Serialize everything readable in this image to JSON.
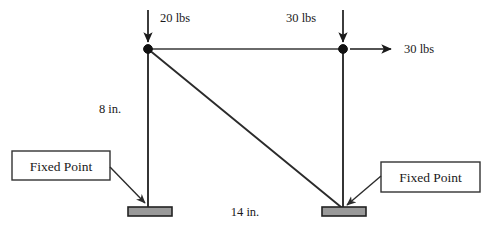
{
  "diagram": {
    "colors": {
      "line": "#2b2b2b",
      "node": "#111111",
      "support_fill": "#9a9a9a",
      "support_stroke": "#222222",
      "text": "#1a1a1a",
      "background": "#ffffff"
    },
    "loads": [
      {
        "id": "load-top-left",
        "label": "20 lbs",
        "direction": "down",
        "applied_at": "left-node"
      },
      {
        "id": "load-top-right",
        "label": "30 lbs",
        "direction": "down",
        "applied_at": "right-node"
      },
      {
        "id": "load-right",
        "label": "30 lbs",
        "direction": "right",
        "applied_at": "right-node"
      }
    ],
    "dimensions": [
      {
        "id": "dim-vertical",
        "label": "8 in.",
        "measures": "left column height"
      },
      {
        "id": "dim-horizontal",
        "label": "14 in.",
        "measures": "span between supports"
      }
    ],
    "callouts": [
      {
        "id": "callout-left",
        "label": "Fixed Point",
        "points_to": "left-support"
      },
      {
        "id": "callout-right",
        "label": "Fixed Point",
        "points_to": "right-support"
      }
    ],
    "nodes": [
      {
        "id": "left-node",
        "x": 148,
        "y": 49
      },
      {
        "id": "right-node",
        "x": 343,
        "y": 49
      }
    ],
    "supports": [
      {
        "id": "left-support",
        "x": 128,
        "y": 207
      },
      {
        "id": "right-support",
        "x": 322,
        "y": 207
      }
    ]
  }
}
